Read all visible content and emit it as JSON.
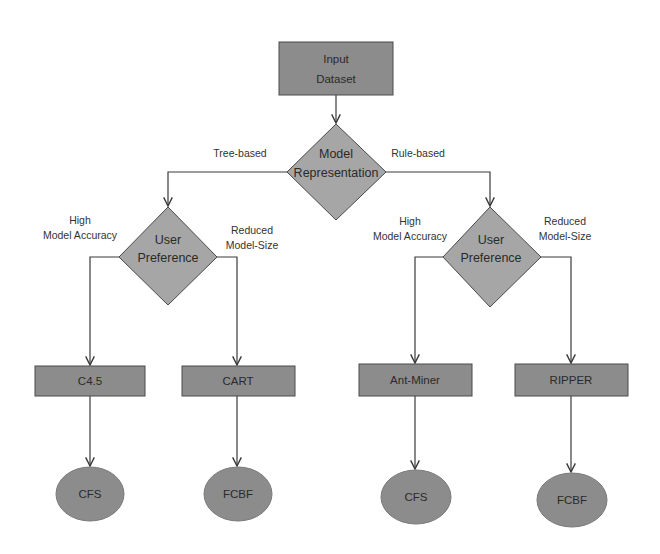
{
  "diagram": {
    "type": "flowchart",
    "colors": {
      "rect_fill": "#8c8c8c",
      "diamond_fill": "#a6a6a6",
      "ellipse_fill": "#8c8c8c",
      "stroke": "#3a3a3a",
      "text": "#2a2a2a"
    },
    "nodes": {
      "input": {
        "line1": "Input",
        "line2": "Dataset"
      },
      "model_rep": {
        "line1": "Model",
        "line2": "Representation"
      },
      "pref_left": {
        "line1": "User",
        "line2": "Preference"
      },
      "pref_right": {
        "line1": "User",
        "line2": "Preference"
      },
      "c45": {
        "label": "C4.5"
      },
      "cart": {
        "label": "CART"
      },
      "antminer": {
        "label": "Ant-Miner"
      },
      "ripper": {
        "label": "RIPPER"
      },
      "cfs_left": {
        "label": "CFS"
      },
      "fcbf_left": {
        "label": "FCBF"
      },
      "cfs_right": {
        "label": "CFS"
      },
      "fcbf_right": {
        "label": "FCBF"
      }
    },
    "edge_labels": {
      "tree_based": "Tree-based",
      "rule_based": "Rule-based",
      "left_high": {
        "line1": "High",
        "line2": "Model Accuracy"
      },
      "left_reduced": {
        "line1": "Reduced",
        "line2": "Model-Size"
      },
      "right_high": {
        "line1": "High",
        "line2": "Model Accuracy"
      },
      "right_reduced": {
        "line1": "Reduced",
        "line2": "Model-Size"
      }
    },
    "edges": [
      {
        "from": "Input Dataset",
        "to": "Model Representation"
      },
      {
        "from": "Model Representation",
        "to": "User Preference (left)",
        "label": "Tree-based"
      },
      {
        "from": "Model Representation",
        "to": "User Preference (right)",
        "label": "Rule-based"
      },
      {
        "from": "User Preference (left)",
        "to": "C4.5",
        "label": "High Model Accuracy"
      },
      {
        "from": "User Preference (left)",
        "to": "CART",
        "label": "Reduced Model-Size"
      },
      {
        "from": "User Preference (right)",
        "to": "Ant-Miner",
        "label": "High Model Accuracy"
      },
      {
        "from": "User Preference (right)",
        "to": "RIPPER",
        "label": "Reduced Model-Size"
      },
      {
        "from": "C4.5",
        "to": "CFS"
      },
      {
        "from": "CART",
        "to": "FCBF"
      },
      {
        "from": "Ant-Miner",
        "to": "CFS"
      },
      {
        "from": "RIPPER",
        "to": "FCBF"
      }
    ]
  }
}
